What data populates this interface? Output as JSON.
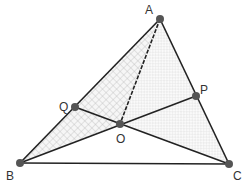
{
  "diagram": {
    "type": "geometry",
    "points": {
      "A": {
        "label": "A",
        "x": 160,
        "y": 19
      },
      "B": {
        "label": "B",
        "x": 20,
        "y": 163
      },
      "C": {
        "label": "C",
        "x": 229,
        "y": 164
      },
      "P": {
        "label": "P",
        "x": 196,
        "y": 96
      },
      "Q": {
        "label": "Q",
        "x": 75,
        "y": 107
      },
      "O": {
        "label": "O",
        "x": 120,
        "y": 124
      }
    },
    "segments": [
      {
        "from": "A",
        "to": "B",
        "style": "solid"
      },
      {
        "from": "B",
        "to": "C",
        "style": "solid"
      },
      {
        "from": "C",
        "to": "A",
        "style": "solid"
      },
      {
        "from": "B",
        "to": "P",
        "style": "solid"
      },
      {
        "from": "C",
        "to": "Q",
        "style": "solid"
      },
      {
        "from": "A",
        "to": "O",
        "style": "dashed"
      }
    ],
    "shaded_regions": [
      {
        "vertices": [
          "A",
          "B",
          "O"
        ],
        "fill": "crosshatch"
      },
      {
        "vertices": [
          "A",
          "O",
          "C"
        ],
        "fill": "light-checker"
      }
    ],
    "colors": {
      "line": "#222222",
      "point": "#555555",
      "label": "#333333",
      "hatch": "#bbbbbb",
      "light_fill": "#f2f2f2"
    }
  }
}
